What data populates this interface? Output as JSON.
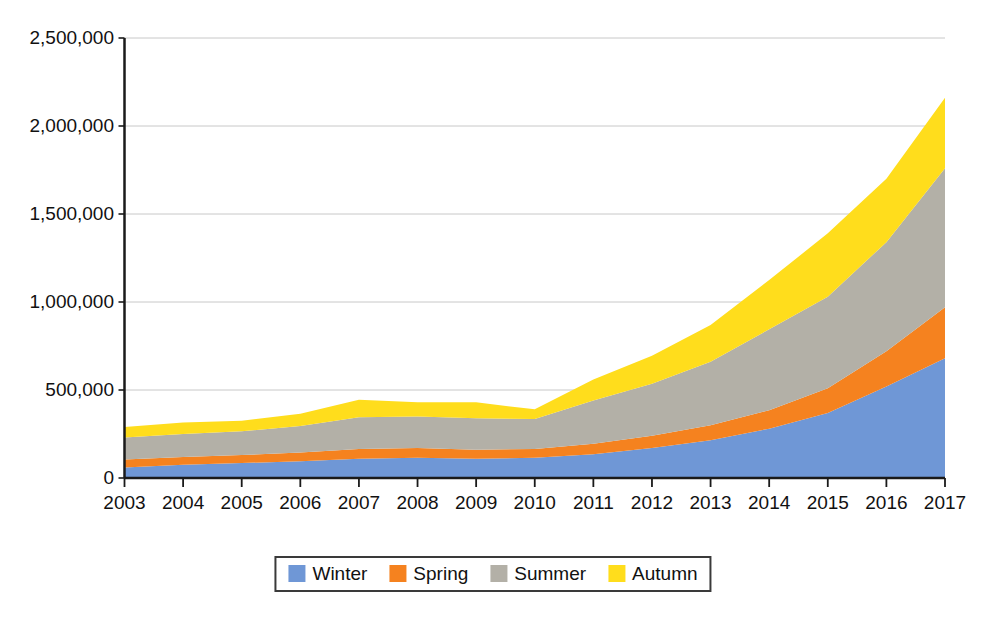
{
  "chart_data": {
    "type": "area",
    "stacked": true,
    "title": "",
    "subtitle": "",
    "xlabel": "",
    "ylabel": "",
    "categories": [
      "2003",
      "2004",
      "2005",
      "2006",
      "2007",
      "2008",
      "2009",
      "2010",
      "2011",
      "2012",
      "2013",
      "2014",
      "2015",
      "2016",
      "2017"
    ],
    "x": [
      2003,
      2004,
      2005,
      2006,
      2007,
      2008,
      2009,
      2010,
      2011,
      2012,
      2013,
      2014,
      2015,
      2016,
      2017
    ],
    "series": [
      {
        "name": "Winter",
        "color": "#6f97d6",
        "values": [
          60000,
          75000,
          85000,
          95000,
          110000,
          115000,
          110000,
          115000,
          135000,
          170000,
          215000,
          280000,
          370000,
          520000,
          680000
        ]
      },
      {
        "name": "Spring",
        "color": "#f5821f",
        "values": [
          45000,
          45000,
          45000,
          50000,
          55000,
          55000,
          50000,
          50000,
          60000,
          70000,
          85000,
          105000,
          140000,
          200000,
          290000
        ]
      },
      {
        "name": "Summer",
        "color": "#b3b0a7",
        "values": [
          125000,
          130000,
          135000,
          150000,
          180000,
          180000,
          180000,
          170000,
          245000,
          295000,
          360000,
          460000,
          520000,
          620000,
          790000
        ]
      },
      {
        "name": "Autumn",
        "color": "#ffdd1c",
        "values": [
          60000,
          65000,
          60000,
          70000,
          100000,
          80000,
          90000,
          55000,
          120000,
          160000,
          210000,
          280000,
          360000,
          360000,
          400000
        ]
      }
    ],
    "stack_totals": [
      290000,
      315000,
      325000,
      365000,
      445000,
      430000,
      430000,
      390000,
      560000,
      695000,
      870000,
      1125000,
      1390000,
      1700000,
      2160000
    ],
    "ylim": [
      0,
      2500000
    ],
    "y_ticks": [
      0,
      500000,
      1000000,
      1500000,
      2000000,
      2500000
    ],
    "y_tick_labels": [
      "0",
      "500,000",
      "1,000,000",
      "1,500,000",
      "2,000,000",
      "2,500,000"
    ],
    "grid": true,
    "grid_axis": "y",
    "grid_color": "#c8c8c8",
    "axis_color": "#1a1a1a",
    "legend_position": "bottom",
    "legend": [
      "Winter",
      "Spring",
      "Summer",
      "Autumn"
    ],
    "background": "#ffffff"
  },
  "legend": {
    "items": [
      {
        "label": "Winter",
        "color": "#6f97d6"
      },
      {
        "label": "Spring",
        "color": "#f5821f"
      },
      {
        "label": "Summer",
        "color": "#b3b0a7"
      },
      {
        "label": "Autumn",
        "color": "#ffdd1c"
      }
    ]
  }
}
